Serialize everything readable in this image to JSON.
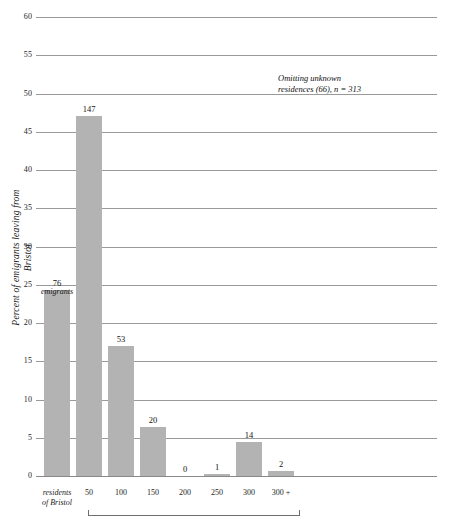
{
  "chart_data": {
    "type": "bar",
    "title": "",
    "subtitle": "",
    "xlabel": "",
    "ylabel": "Percent of emigrants leaving from Bristol",
    "ylim": [
      0,
      60
    ],
    "ytick_step": 5,
    "grid": true,
    "legend": false,
    "annotation": {
      "line1": "Omitting unknown",
      "line2": "residences (66), n = 313"
    },
    "categories": [
      "residents of Bristol",
      "50",
      "100",
      "150",
      "200",
      "250",
      "300",
      "300 +"
    ],
    "category_labels_multiline": [
      [
        "residents",
        "of Bristol"
      ],
      [
        "50"
      ],
      [
        "100"
      ],
      [
        "150"
      ],
      [
        "200"
      ],
      [
        "250"
      ],
      [
        "300"
      ],
      [
        "300 +"
      ]
    ],
    "values": [
      24.3,
      47.0,
      17.0,
      6.4,
      0.0,
      0.3,
      4.5,
      0.6
    ],
    "counts": [
      76,
      147,
      53,
      20,
      0,
      1,
      14,
      2
    ],
    "count_labels": [
      "76",
      "147",
      "53",
      "20",
      "0",
      "1",
      "14",
      "2"
    ],
    "first_bar_sublabel": "emigrants",
    "yticks": [
      "0",
      "5",
      "10",
      "15",
      "20",
      "25",
      "30",
      "35",
      "40",
      "45",
      "50",
      "55",
      "60"
    ],
    "bar_color": "#b3b3b3",
    "grid_color": "#9a9a9a",
    "text_color": "#1a1a1a"
  }
}
